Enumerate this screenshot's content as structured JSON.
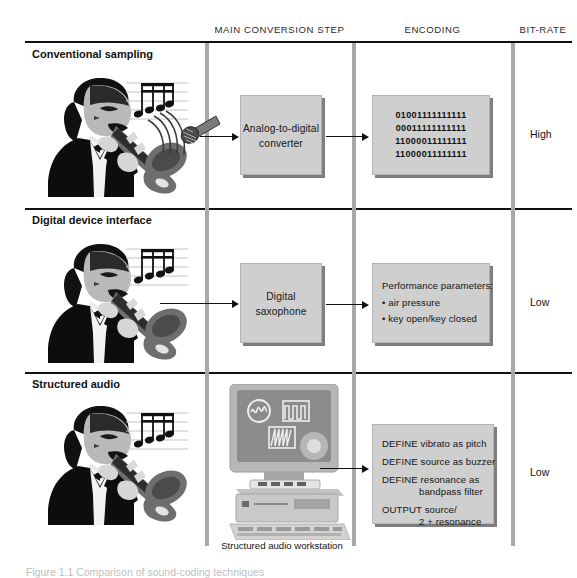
{
  "figure": {
    "columns": [
      {
        "id": "main-conversion-step",
        "label": "MAIN CONVERSION STEP"
      },
      {
        "id": "encoding",
        "label": "ENCODING"
      },
      {
        "id": "bit-rate",
        "label": "BIT-RATE"
      }
    ],
    "rows": [
      {
        "id": "conventional-sampling",
        "title": "Conventional sampling",
        "step_box": "Analog-to-digital\nconverter",
        "step_line1": "Analog-to-digital",
        "step_line2": "converter",
        "encoding_type": "bits",
        "encoding_bits": [
          "01001111111111",
          "00011111111111",
          "11000011111111",
          "11000011111111"
        ],
        "bit_rate": "High",
        "source_icon": "saxophone-player",
        "capture_icon": "microphone"
      },
      {
        "id": "digital-device-interface",
        "title": "Digital device interface",
        "step_line1": "Digital",
        "step_line2": "saxophone",
        "encoding_type": "list",
        "encoding_heading": "Performance parameters:",
        "encoding_items": [
          "• air pressure",
          "• key open/key closed"
        ],
        "bit_rate": "Low",
        "source_icon": "saxophone-player"
      },
      {
        "id": "structured-audio",
        "title": "Structured audio",
        "step_type": "workstation",
        "workstation_caption": "Structured audio workstation",
        "encoding_type": "code",
        "encoding_code": [
          "DEFINE vibrato as pitch",
          "DEFINE source as buzzer",
          "DEFINE resonance as",
          "bandpass filter",
          "OUTPUT source/",
          "2 + resonance"
        ],
        "bit_rate": "Low",
        "source_icon": "saxophone-player"
      }
    ],
    "caption": "Figure 1.1  Comparison of sound-coding techniques",
    "colors": {
      "box_fill": "#cfcfcf",
      "box_shadow": "#7e7e7e",
      "divider": "#a8a8a8",
      "rule": "#111111",
      "screen": "#8c8c8c"
    }
  }
}
